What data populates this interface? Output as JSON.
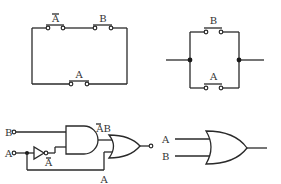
{
  "series_circuit": {
    "switch_top_left": "A",
    "switch_top_left_negated": true,
    "switch_top_right": "B",
    "switch_bottom": "A"
  },
  "parallel_circuit": {
    "switch_top": "B",
    "switch_bottom": "A"
  },
  "logic_circuit": {
    "input_b": "B",
    "input_a": "A",
    "not_output": "A",
    "not_output_negated": true,
    "and_output_a": "A",
    "and_output_b": "B",
    "and_output_a_negated": true,
    "feedback_label": "A"
  },
  "or_gate": {
    "input_a": "A",
    "input_b": "B"
  }
}
